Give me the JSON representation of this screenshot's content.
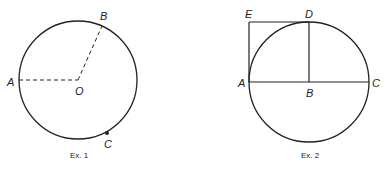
{
  "figures": [
    {
      "caption": "Ex. 1",
      "labels": {
        "A": "A",
        "B": "B",
        "O": "O",
        "C": "C"
      }
    },
    {
      "caption": "Ex. 2",
      "labels": {
        "E": "E",
        "D": "D",
        "A": "A",
        "B": "B",
        "C": "C"
      }
    }
  ],
  "colors": {
    "stroke": "#222222"
  }
}
